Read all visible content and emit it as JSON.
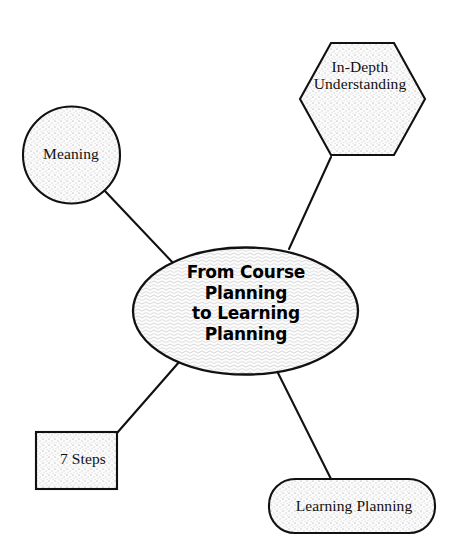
{
  "diagram": {
    "title": "From Course Planning to Learning Planning",
    "type": "mind-map",
    "background_color": "#ffffff",
    "stroke_color": "#111111",
    "fill_color": "#f2f2f2",
    "center": {
      "id": "center-node",
      "shape": "ellipse",
      "label": "From Course\nPlanning\nto Learning\nPlanning",
      "text_style": "bold-sans"
    },
    "nodes": [
      {
        "id": "node-meaning",
        "shape": "circle",
        "label": "Meaning",
        "position": "upper-left"
      },
      {
        "id": "node-in-depth-understanding",
        "shape": "hexagon",
        "label": "In-Depth\nUnderstanding",
        "position": "upper-right"
      },
      {
        "id": "node-7-steps",
        "shape": "rectangle",
        "label": "7 Steps",
        "position": "lower-left"
      },
      {
        "id": "node-learning-planning",
        "shape": "rounded-rectangle",
        "label": "Learning Planning",
        "position": "lower-right"
      }
    ],
    "connectors": [
      {
        "id": "connector-meaning",
        "from": "node-meaning",
        "to": "center-node"
      },
      {
        "id": "connector-in-depth-understanding",
        "from": "node-in-depth-understanding",
        "to": "center-node"
      },
      {
        "id": "connector-7-steps",
        "from": "node-7-steps",
        "to": "center-node"
      },
      {
        "id": "connector-learning-planning",
        "from": "node-learning-planning",
        "to": "center-node"
      }
    ]
  }
}
